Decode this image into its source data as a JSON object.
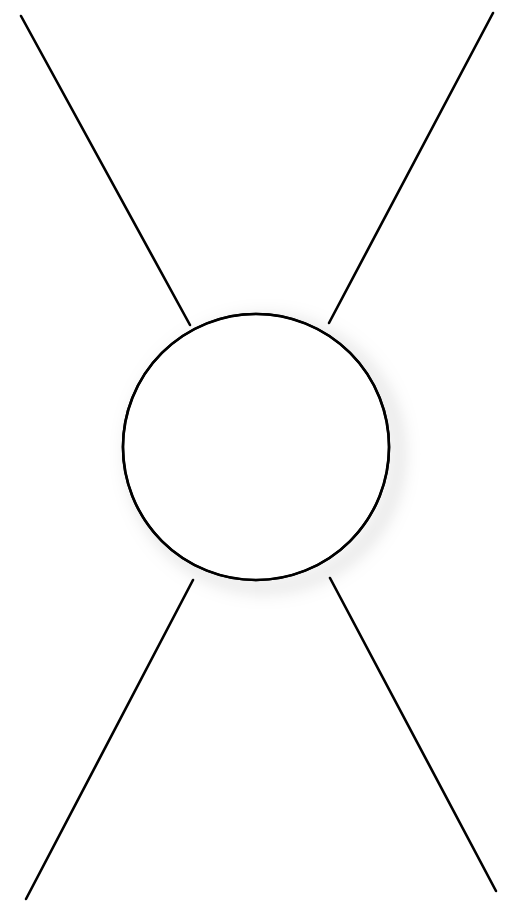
{
  "figure": {
    "name": "s-channel-loop-diagram",
    "description": "Line drawing: a circle with four straight lines extending to the image corners",
    "background_color": "#ffffff",
    "stroke_color": "#000000",
    "shadow_color": "#808080",
    "canvas": {
      "width": 519,
      "height": 916
    },
    "circle": {
      "name": "central-loop-circle",
      "center_x": 256,
      "center_y": 447,
      "radius": 133,
      "stroke_width": 2.6,
      "fill": "none",
      "shadow_offset_x": 9,
      "shadow_offset_y": 7,
      "shadow_blur": 9,
      "shadow_opacity": 0.55
    },
    "lines": [
      {
        "name": "upper-left-leg",
        "x1": 21,
        "y1": 16,
        "x2": 190,
        "y2": 325,
        "stroke_width": 2.6
      },
      {
        "name": "upper-right-leg",
        "x1": 493,
        "y1": 13,
        "x2": 329,
        "y2": 323,
        "stroke_width": 2.6
      },
      {
        "name": "lower-left-leg",
        "x1": 26,
        "y1": 899,
        "x2": 193,
        "y2": 580,
        "stroke_width": 2.6
      },
      {
        "name": "lower-right-leg",
        "x1": 496,
        "y1": 891,
        "x2": 330,
        "y2": 578,
        "stroke_width": 2.6
      }
    ]
  }
}
